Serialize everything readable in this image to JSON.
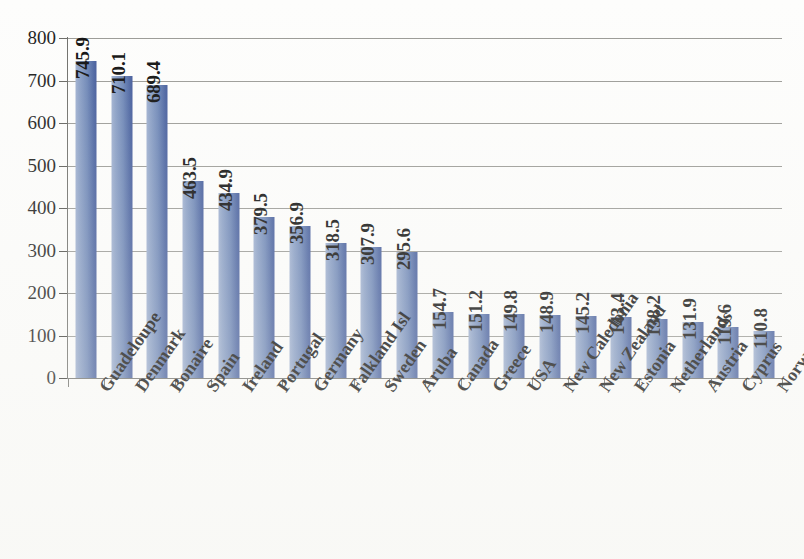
{
  "chart_data": {
    "type": "bar",
    "title": "",
    "subtitle": "",
    "xlabel": "",
    "ylabel": "",
    "ylim": [
      0,
      800
    ],
    "ytick_labels": [
      "800",
      "700",
      "600",
      "500",
      "400",
      "300",
      "200",
      "100",
      "0"
    ],
    "ytick_values": [
      800,
      700,
      600,
      500,
      400,
      300,
      200,
      100,
      0
    ],
    "grid": true,
    "legend": "none",
    "orientation": "vertical",
    "value_labels_shown": true,
    "categories": [
      "Guadeloupe",
      "Denmark",
      "Bonaire",
      "Spain",
      "Ireland",
      "Portugal",
      "Germany",
      "Falkland Isl",
      "Sweden",
      "Aruba",
      "Canada",
      "Greece",
      "USA",
      "New Caledonia",
      "New Zealand",
      "Estonia",
      "Netherlands",
      "Austria",
      "Cyprus",
      "Norway"
    ],
    "values": [
      745.9,
      710.1,
      689.4,
      463.5,
      434.9,
      379.5,
      356.9,
      318.5,
      307.9,
      295.6,
      154.7,
      151.2,
      149.8,
      148.9,
      145.2,
      143.4,
      138.2,
      131.9,
      119.6,
      110.8
    ],
    "value_label_texts": [
      "745.9",
      "710.1",
      "689.4",
      "463.5",
      "434.9",
      "379.5",
      "356.9",
      "318.5",
      "307.9",
      "295.6",
      "154.7",
      "151.2",
      "149.8",
      "148.9",
      "145.2",
      "143.4",
      "138.2",
      "131.9",
      "119.6",
      "110.8"
    ],
    "series": [
      {
        "name": "Series 1",
        "values": [
          745.9,
          710.1,
          689.4,
          463.5,
          434.9,
          379.5,
          356.9,
          318.5,
          307.9,
          295.6,
          154.7,
          151.2,
          149.8,
          148.9,
          145.2,
          143.4,
          138.2,
          131.9,
          119.6,
          110.8
        ]
      }
    ],
    "colors": {
      "bar_light": "#9fb0d0",
      "bar_dark": "#42599a",
      "gridline": "#9a9a96",
      "axis": "#6e6e6a",
      "text": "#0f0f0f",
      "background": "#fdfdfc"
    }
  }
}
